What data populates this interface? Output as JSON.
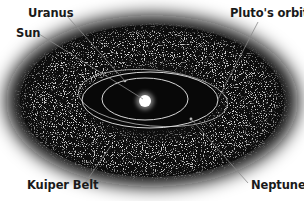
{
  "diagram": {
    "labels": {
      "uranus": "Uranus",
      "sun": "Sun",
      "pluto_orbit": "Pluto's orbit",
      "kuiper_belt": "Kuiper Belt",
      "neptune": "Neptune"
    },
    "colors": {
      "background": "#ffffff",
      "space": "#0b0b0b",
      "orbit": "#d9d9d9",
      "leader_line": "#8a8a8a",
      "sun_glow": "#ffffff",
      "label_text": "#1a1a1a"
    }
  }
}
